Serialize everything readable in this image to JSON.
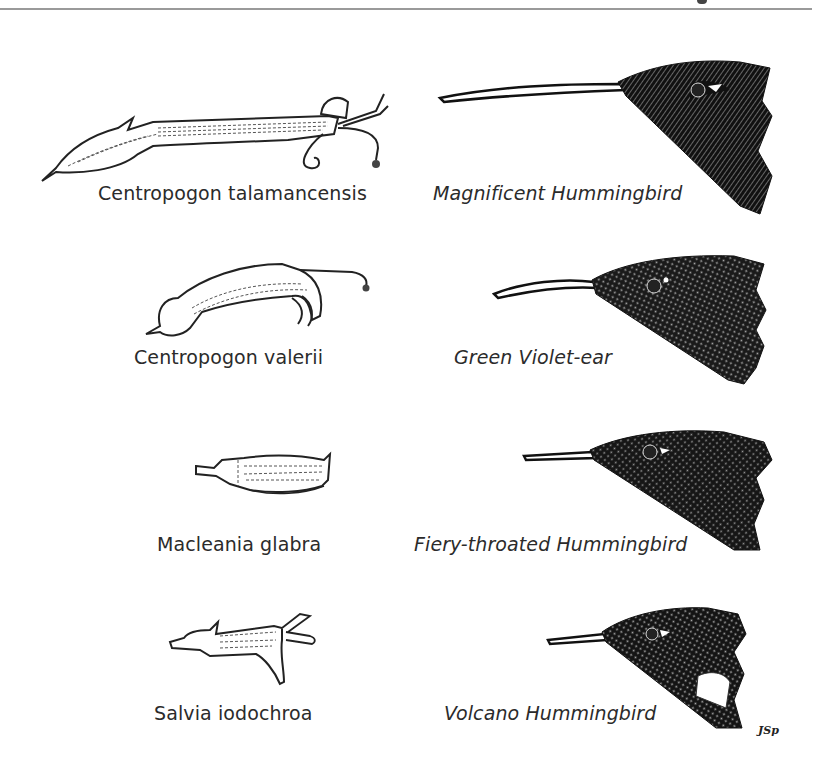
{
  "page": {
    "header_rule": true,
    "signature": "JSp"
  },
  "plate": {
    "rows": [
      {
        "flower": {
          "name": "Centropogon talamancensis",
          "icon": "flower-illustration-long-tubular"
        },
        "bird": {
          "name": "Magnificent Hummingbird",
          "icon": "hummingbird-head-long-bill"
        }
      },
      {
        "flower": {
          "name": "Centropogon valerii",
          "icon": "flower-illustration-curved"
        },
        "bird": {
          "name": "Green Violet-ear",
          "icon": "hummingbird-head-curved-bill"
        }
      },
      {
        "flower": {
          "name": "Macleania glabra",
          "icon": "flower-illustration-short-tubular"
        },
        "bird": {
          "name": "Fiery-throated Hummingbird",
          "icon": "hummingbird-head-medium-bill"
        }
      },
      {
        "flower": {
          "name": "Salvia iodochroa",
          "icon": "flower-illustration-lipped"
        },
        "bird": {
          "name": "Volcano Hummingbird",
          "icon": "hummingbird-head-short-bill"
        }
      }
    ]
  }
}
